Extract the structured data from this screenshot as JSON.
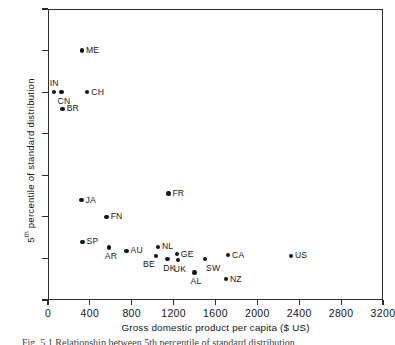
{
  "chart_data": {
    "type": "scatter",
    "title": "",
    "xlabel": "Gross domestic product per capita ($ US)",
    "ylabel": "5th percentile of standard distribution",
    "ylabel_prefix": "5",
    "ylabel_sup": "th",
    "ylabel_suffix": " percentile of standard distribution",
    "xlim": [
      0,
      3200
    ],
    "ylim": [
      150,
      500
    ],
    "xticks": [
      0,
      400,
      800,
      1200,
      1600,
      2000,
      2400,
      2800,
      3200
    ],
    "xtick_labels": [
      "0",
      "400",
      "800",
      "1200",
      "1600",
      "2000",
      "2400",
      "2800",
      "3200"
    ],
    "yticks": [
      150,
      200,
      250,
      300,
      350,
      400,
      450,
      500
    ],
    "ytick_labels": [
      "150",
      "200",
      "250",
      "300",
      "350",
      "400",
      "450",
      "500"
    ],
    "grid": false,
    "legend": false,
    "marker_color": "#161616",
    "axis_color": "#2b2b2b",
    "points": [
      {
        "label": "IN",
        "x": 55,
        "y": 400,
        "label_pos": "t"
      },
      {
        "label": "CN",
        "x": 130,
        "y": 400,
        "label_pos": "b"
      },
      {
        "label": "BR",
        "x": 140,
        "y": 380,
        "label_pos": "r"
      },
      {
        "label": "ME",
        "x": 325,
        "y": 450,
        "label_pos": "r"
      },
      {
        "label": "CH",
        "x": 375,
        "y": 400,
        "label_pos": "r"
      },
      {
        "label": "JA",
        "x": 320,
        "y": 270,
        "label_pos": "r"
      },
      {
        "label": "FN",
        "x": 560,
        "y": 250,
        "label_pos": "r"
      },
      {
        "label": "FR",
        "x": 1150,
        "y": 278,
        "label_pos": "r"
      },
      {
        "label": "SP",
        "x": 330,
        "y": 220,
        "label_pos": "r"
      },
      {
        "label": "AR",
        "x": 580,
        "y": 213,
        "label_pos": "b"
      },
      {
        "label": "AU",
        "x": 750,
        "y": 209,
        "label_pos": "r"
      },
      {
        "label": "NL",
        "x": 1050,
        "y": 214,
        "label_pos": "r"
      },
      {
        "label": "BE",
        "x": 1030,
        "y": 203,
        "label_pos": "bl"
      },
      {
        "label": "DK",
        "x": 1140,
        "y": 199,
        "label_pos": "b"
      },
      {
        "label": "GE",
        "x": 1230,
        "y": 205,
        "label_pos": "r"
      },
      {
        "label": "UK",
        "x": 1240,
        "y": 198,
        "label_pos": "b"
      },
      {
        "label": "AL",
        "x": 1400,
        "y": 183,
        "label_pos": "b"
      },
      {
        "label": "SW",
        "x": 1500,
        "y": 199,
        "label_pos": "br"
      },
      {
        "label": "NZ",
        "x": 1700,
        "y": 175,
        "label_pos": "r"
      },
      {
        "label": "CA",
        "x": 1720,
        "y": 204,
        "label_pos": "r"
      },
      {
        "label": "US",
        "x": 2320,
        "y": 203,
        "label_pos": "r"
      }
    ]
  },
  "caption": "Fig. 5.1  Relationship between 5th percentile of standard distribution"
}
